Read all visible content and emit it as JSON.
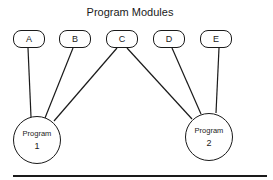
{
  "title": "Program Modules",
  "modules": [
    {
      "label": "A"
    },
    {
      "label": "B"
    },
    {
      "label": "C"
    },
    {
      "label": "D"
    },
    {
      "label": "E"
    }
  ],
  "programs": [
    {
      "label": "Program",
      "number": "1"
    },
    {
      "label": "Program",
      "number": "2"
    }
  ],
  "connections": [
    {
      "from": "A",
      "to": "Program 1"
    },
    {
      "from": "B",
      "to": "Program 1"
    },
    {
      "from": "C",
      "to": "Program 1"
    },
    {
      "from": "C",
      "to": "Program 2"
    },
    {
      "from": "D",
      "to": "Program 2"
    },
    {
      "from": "E",
      "to": "Program 2"
    }
  ],
  "colors": {
    "stroke": "#1a1a1a",
    "background": "#ffffff"
  }
}
